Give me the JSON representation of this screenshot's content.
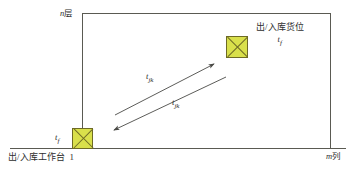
{
  "figure": {
    "caption": ""
  },
  "axes": {
    "vertical_label": "n",
    "vertical_unit": "层",
    "horizontal_label": "m",
    "horizontal_unit": "列"
  },
  "nodes": {
    "destination": {
      "name": "出/入库货位",
      "term": "t",
      "term_subscript": "f",
      "fill_color": "#d9e04b",
      "border_color": "#6e6b25"
    },
    "origin": {
      "name": "出/入库工作台",
      "station_number": "1",
      "term": "t",
      "term_subscript": "f",
      "fill_color": "#d9e04b",
      "border_color": "#6e6b25"
    }
  },
  "arrows": [
    {
      "id": "outbound",
      "label": "t",
      "label_subscript": "jk",
      "direction": "工作台到货位",
      "color": "#4a4a46"
    },
    {
      "id": "inbound",
      "label": "t",
      "label_subscript": "jk",
      "direction": "货位到工作台",
      "color": "#4a4a46"
    }
  ],
  "colors": {
    "line": "#5a5a52",
    "text": "#2e2e2e",
    "background": "#ffffff"
  }
}
